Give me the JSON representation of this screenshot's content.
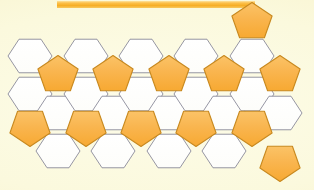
{
  "page": {
    "title": "Hexagon and pentagon tiling pattern",
    "width": 314,
    "height": 190,
    "background_color": "#fbf8dc"
  },
  "top_bar": {
    "name": "orange-divider-bar",
    "color": "#f6ae26",
    "x": 57,
    "y": 1,
    "width": 198,
    "height": 7
  },
  "palette": {
    "background": "#fbf8dc",
    "background_edge": "#f4edbd",
    "hexagon_fill": "#ffffff",
    "hexagon_stroke": "#8a8a9a",
    "pentagon_fill": "#f8b14a",
    "pentagon_fill_light": "#fbc974",
    "pentagon_stroke": "#c8891f",
    "bar_color": "#f6ae26"
  },
  "tiling": {
    "name": "hexagon-pentagon-tiling",
    "hexagon_count": 22,
    "pentagon_count": 13,
    "hex_radius": 22,
    "column_step": 27.6,
    "row_step": 38,
    "description": "Flat-top white hexagons in staggered columns interleaved with orange pentagons",
    "shapes": [
      {
        "id": "hex-c1-r1",
        "type": "hexagon",
        "cx": 30,
        "cy": 56,
        "r": 22,
        "rot": 0,
        "fill": "#ffffff",
        "stroke": "#8a8a9a"
      },
      {
        "id": "hex-c1-r2",
        "type": "hexagon",
        "cx": 30,
        "cy": 94,
        "r": 22,
        "rot": 0,
        "fill": "#ffffff",
        "stroke": "#8a8a9a"
      },
      {
        "id": "pent-c1-r3",
        "type": "pentagon",
        "cx": 30,
        "cy": 127,
        "r": 22,
        "rot": 180,
        "fill": "#f8b14a",
        "stroke": "#c8891f"
      },
      {
        "id": "pent-c2-r0",
        "type": "pentagon",
        "cx": 58,
        "cy": 75,
        "r": 22,
        "rot": 0,
        "fill": "#f8b14a",
        "stroke": "#c8891f"
      },
      {
        "id": "hex-c2-r1",
        "type": "hexagon",
        "cx": 58,
        "cy": 113,
        "r": 22,
        "rot": 0,
        "fill": "#ffffff",
        "stroke": "#8a8a9a"
      },
      {
        "id": "hex-c2-r2",
        "type": "hexagon",
        "cx": 58,
        "cy": 151,
        "r": 22,
        "rot": 0,
        "fill": "#ffffff",
        "stroke": "#8a8a9a"
      },
      {
        "id": "hex-c3-r1",
        "type": "hexagon",
        "cx": 86,
        "cy": 56,
        "r": 22,
        "rot": 0,
        "fill": "#ffffff",
        "stroke": "#8a8a9a"
      },
      {
        "id": "hex-c3-r2",
        "type": "hexagon",
        "cx": 86,
        "cy": 94,
        "r": 22,
        "rot": 0,
        "fill": "#ffffff",
        "stroke": "#8a8a9a"
      },
      {
        "id": "pent-c3-r3",
        "type": "pentagon",
        "cx": 86,
        "cy": 127,
        "r": 22,
        "rot": 180,
        "fill": "#f8b14a",
        "stroke": "#c8891f"
      },
      {
        "id": "pent-c4-r0",
        "type": "pentagon",
        "cx": 113,
        "cy": 75,
        "r": 22,
        "rot": 0,
        "fill": "#f8b14a",
        "stroke": "#c8891f"
      },
      {
        "id": "hex-c4-r1",
        "type": "hexagon",
        "cx": 113,
        "cy": 113,
        "r": 22,
        "rot": 0,
        "fill": "#ffffff",
        "stroke": "#8a8a9a"
      },
      {
        "id": "hex-c4-r2",
        "type": "hexagon",
        "cx": 113,
        "cy": 151,
        "r": 22,
        "rot": 0,
        "fill": "#ffffff",
        "stroke": "#8a8a9a"
      },
      {
        "id": "hex-c5-r1",
        "type": "hexagon",
        "cx": 141,
        "cy": 56,
        "r": 22,
        "rot": 0,
        "fill": "#ffffff",
        "stroke": "#8a8a9a"
      },
      {
        "id": "hex-c5-r2",
        "type": "hexagon",
        "cx": 141,
        "cy": 94,
        "r": 22,
        "rot": 0,
        "fill": "#ffffff",
        "stroke": "#8a8a9a"
      },
      {
        "id": "pent-c5-r3",
        "type": "pentagon",
        "cx": 141,
        "cy": 127,
        "r": 22,
        "rot": 180,
        "fill": "#f8b14a",
        "stroke": "#c8891f"
      },
      {
        "id": "pent-c6-r0",
        "type": "pentagon",
        "cx": 169,
        "cy": 75,
        "r": 22,
        "rot": 0,
        "fill": "#f8b14a",
        "stroke": "#c8891f"
      },
      {
        "id": "hex-c6-r1",
        "type": "hexagon",
        "cx": 169,
        "cy": 113,
        "r": 22,
        "rot": 0,
        "fill": "#ffffff",
        "stroke": "#8a8a9a"
      },
      {
        "id": "hex-c6-r2",
        "type": "hexagon",
        "cx": 169,
        "cy": 151,
        "r": 22,
        "rot": 0,
        "fill": "#ffffff",
        "stroke": "#8a8a9a"
      },
      {
        "id": "hex-c7-r1",
        "type": "hexagon",
        "cx": 196,
        "cy": 56,
        "r": 22,
        "rot": 0,
        "fill": "#ffffff",
        "stroke": "#8a8a9a"
      },
      {
        "id": "hex-c7-r2",
        "type": "hexagon",
        "cx": 196,
        "cy": 94,
        "r": 22,
        "rot": 0,
        "fill": "#ffffff",
        "stroke": "#8a8a9a"
      },
      {
        "id": "pent-c7-r3",
        "type": "pentagon",
        "cx": 196,
        "cy": 127,
        "r": 22,
        "rot": 180,
        "fill": "#f8b14a",
        "stroke": "#c8891f"
      },
      {
        "id": "pent-c8-r0",
        "type": "pentagon",
        "cx": 224,
        "cy": 75,
        "r": 22,
        "rot": 0,
        "fill": "#f8b14a",
        "stroke": "#c8891f"
      },
      {
        "id": "hex-c8-r1",
        "type": "hexagon",
        "cx": 224,
        "cy": 113,
        "r": 22,
        "rot": 0,
        "fill": "#ffffff",
        "stroke": "#8a8a9a"
      },
      {
        "id": "hex-c8-r2",
        "type": "hexagon",
        "cx": 224,
        "cy": 151,
        "r": 22,
        "rot": 0,
        "fill": "#ffffff",
        "stroke": "#8a8a9a"
      },
      {
        "id": "pent-c9-r0",
        "type": "pentagon",
        "cx": 252,
        "cy": 22,
        "r": 22,
        "rot": 0,
        "fill": "#f8b14a",
        "stroke": "#c8891f"
      },
      {
        "id": "hex-c9-r1",
        "type": "hexagon",
        "cx": 252,
        "cy": 56,
        "r": 22,
        "rot": 0,
        "fill": "#ffffff",
        "stroke": "#8a8a9a"
      },
      {
        "id": "hex-c9-r2",
        "type": "hexagon",
        "cx": 252,
        "cy": 94,
        "r": 22,
        "rot": 0,
        "fill": "#ffffff",
        "stroke": "#8a8a9a"
      },
      {
        "id": "pent-c9-r3",
        "type": "pentagon",
        "cx": 252,
        "cy": 127,
        "r": 22,
        "rot": 180,
        "fill": "#f8b14a",
        "stroke": "#c8891f"
      },
      {
        "id": "pent-c10-r0",
        "type": "pentagon",
        "cx": 280,
        "cy": 75,
        "r": 22,
        "rot": 0,
        "fill": "#f8b14a",
        "stroke": "#c8891f"
      },
      {
        "id": "hex-c10-r1",
        "type": "hexagon",
        "cx": 280,
        "cy": 113,
        "r": 22,
        "rot": 0,
        "fill": "#ffffff",
        "stroke": "#8a8a9a"
      },
      {
        "id": "pent-c10-r2",
        "type": "pentagon",
        "cx": 280,
        "cy": 162,
        "r": 22,
        "rot": 180,
        "fill": "#f8b14a",
        "stroke": "#c8891f"
      }
    ]
  }
}
